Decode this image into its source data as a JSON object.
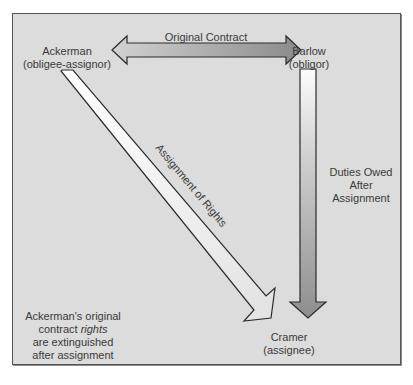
{
  "diagram": {
    "nodes": {
      "ackerman": {
        "name": "Ackerman",
        "role": "(obligee-assignor)"
      },
      "barlow": {
        "name": "Barlow",
        "role": "(obligor)"
      },
      "cramer": {
        "name": "Cramer",
        "role": "(assignee)"
      }
    },
    "arrows": {
      "original_contract": {
        "label": "Original Contract",
        "from": "Ackerman",
        "to": "Barlow",
        "direction": "bidirectional"
      },
      "assignment_of_rights": {
        "label": "Assignment of Rights",
        "from": "Ackerman",
        "to": "Cramer",
        "direction": "one-way"
      },
      "duties_owed": {
        "line1": "Duties Owed",
        "line2": "After",
        "line3": "Assignment",
        "from": "Barlow",
        "to": "Cramer",
        "direction": "one-way"
      }
    },
    "note": {
      "line1": "Ackerman's original",
      "line2_pre": "contract ",
      "line2_italic": "rights",
      "line3": "are extinguished",
      "line4": "after assignment"
    },
    "colors": {
      "background": "#dcdcdc",
      "border": "#555555",
      "text": "#3a3a3a",
      "arrow_dark": "#8c8c8c",
      "arrow_light": "#fafafa"
    }
  }
}
